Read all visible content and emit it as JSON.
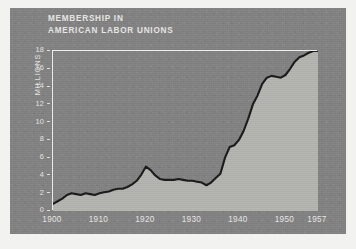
{
  "figure": {
    "title_line1": "MEMBERSHIP IN",
    "title_line2": "AMERICAN LABOR UNIONS",
    "panel_color": "#838383",
    "fill_color": "#b5b5b1",
    "line_color": "#1a1a1a",
    "frame_color": "#f0efec",
    "text_color": "#e9e9e6"
  },
  "chart_data": {
    "type": "area",
    "title": "MEMBERSHIP IN AMERICAN LABOR UNIONS",
    "xlabel": "",
    "ylabel": "MILLIONS",
    "xlim": [
      1900,
      1957
    ],
    "ylim": [
      0,
      18
    ],
    "grid": false,
    "legend": null,
    "xticks": [
      1900,
      1910,
      1920,
      1930,
      1940,
      1950,
      1957
    ],
    "xtick_labels": [
      "1900",
      "1910",
      "1920",
      "1930",
      "1940",
      "1950",
      "1957"
    ],
    "yticks": [
      0,
      2,
      4,
      6,
      8,
      10,
      12,
      14,
      16,
      18
    ],
    "ytick_labels": [
      "0",
      "2",
      "4",
      "6",
      "8",
      "10",
      "12",
      "14",
      "16",
      "18"
    ],
    "x": [
      1900,
      1901,
      1902,
      1903,
      1904,
      1905,
      1906,
      1907,
      1908,
      1909,
      1910,
      1911,
      1912,
      1913,
      1914,
      1915,
      1916,
      1917,
      1918,
      1919,
      1920,
      1921,
      1922,
      1923,
      1924,
      1925,
      1926,
      1927,
      1928,
      1929,
      1930,
      1931,
      1932,
      1933,
      1934,
      1935,
      1936,
      1937,
      1938,
      1939,
      1940,
      1941,
      1942,
      1943,
      1944,
      1945,
      1946,
      1947,
      1948,
      1949,
      1950,
      1951,
      1952,
      1953,
      1954,
      1955,
      1956,
      1957
    ],
    "values": [
      0.8,
      1.1,
      1.4,
      1.8,
      2.0,
      1.9,
      1.8,
      2.0,
      1.9,
      1.8,
      2.0,
      2.1,
      2.2,
      2.4,
      2.5,
      2.5,
      2.7,
      3.0,
      3.4,
      4.1,
      5.0,
      4.6,
      4.0,
      3.6,
      3.5,
      3.5,
      3.5,
      3.6,
      3.5,
      3.4,
      3.4,
      3.3,
      3.2,
      2.9,
      3.2,
      3.7,
      4.2,
      6.0,
      7.2,
      7.4,
      8.0,
      9.0,
      10.4,
      12.0,
      13.0,
      14.3,
      15.0,
      15.2,
      15.1,
      15.0,
      15.3,
      16.0,
      16.8,
      17.3,
      17.5,
      17.8,
      18.0,
      18.0
    ],
    "units": "millions of members",
    "series_name": "Union membership"
  }
}
